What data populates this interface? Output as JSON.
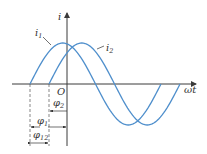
{
  "diagram": {
    "type": "phase-difference-sine-waves",
    "axes": {
      "y_label": "i",
      "x_label": "ωt",
      "origin_label": "O"
    },
    "curves": [
      {
        "name": "i1",
        "label": "i",
        "subscript": "1",
        "color": "#4f8fcc",
        "phase_label": "φ1"
      },
      {
        "name": "i2",
        "label": "i",
        "subscript": "2",
        "color": "#4f8fcc",
        "phase_label": "φ2"
      }
    ],
    "phase_labels": {
      "phi2": {
        "symbol": "φ",
        "subscript": "2"
      },
      "phi1": {
        "symbol": "φ",
        "subscript": "1"
      },
      "phi12": {
        "symbol": "φ",
        "subscript": "12"
      }
    }
  }
}
